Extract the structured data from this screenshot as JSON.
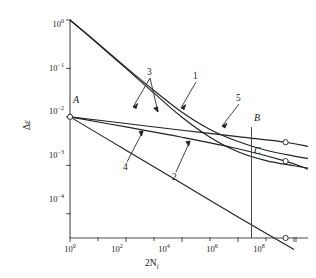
{
  "chart_data": {
    "type": "line",
    "title": "",
    "xlabel": "2N_f",
    "ylabel": "Δε",
    "xscale": "log",
    "yscale": "log",
    "xlim": [
      1,
      316000000.0
    ],
    "ylim": [
      3.16e-05,
      1
    ],
    "grid": false,
    "legend": "none",
    "x_ticks": [
      {
        "value": 1,
        "mantissa": "10",
        "exponent": "0"
      },
      {
        "value": 100,
        "mantissa": "10",
        "exponent": "2"
      },
      {
        "value": 10000,
        "mantissa": "10",
        "exponent": "4"
      },
      {
        "value": 1000000,
        "mantissa": "10",
        "exponent": "6"
      },
      {
        "value": 100000000,
        "mantissa": "10",
        "exponent": "8"
      }
    ],
    "y_ticks": [
      {
        "value": 1,
        "mantissa": "10",
        "exponent": "0"
      },
      {
        "value": 0.1,
        "mantissa": "10",
        "exponent": "−1"
      },
      {
        "value": 0.01,
        "mantissa": "10",
        "exponent": "−2"
      },
      {
        "value": 0.001,
        "mantissa": "10",
        "exponent": "−3"
      },
      {
        "value": 0.0001,
        "mantissa": "10",
        "exponent": "−4"
      }
    ],
    "series": [
      {
        "name": "1",
        "label": "1",
        "points": [
          [
            1,
            1.0
          ],
          [
            10,
            0.33
          ],
          [
            100,
            0.105
          ],
          [
            1000,
            0.035
          ],
          [
            10000,
            0.0125
          ],
          [
            100000,
            0.0055
          ],
          [
            1000000,
            0.0031
          ],
          [
            10000000,
            0.00205
          ],
          [
            100000000,
            0.00155
          ],
          [
            316000000,
            0.00138
          ]
        ]
      },
      {
        "name": "3",
        "label": "3",
        "points": [
          [
            1,
            1.0
          ],
          [
            10,
            0.32
          ],
          [
            100,
            0.1
          ],
          [
            1000,
            0.031
          ],
          [
            10000,
            0.0098
          ],
          [
            100000,
            0.0038
          ],
          [
            1000000,
            0.0019
          ],
          [
            10000000,
            0.00125
          ],
          [
            100000000,
            0.00098
          ],
          [
            316000000,
            0.00088
          ]
        ]
      },
      {
        "name": "5",
        "label": "5",
        "points": [
          [
            1,
            0.01
          ],
          [
            100,
            0.0073
          ],
          [
            10000,
            0.0053
          ],
          [
            1000000,
            0.0039
          ],
          [
            50000000,
            0.003
          ],
          [
            316000000,
            0.00245
          ]
        ]
      },
      {
        "name": "4",
        "label": "4",
        "points": [
          [
            1,
            0.01
          ],
          [
            100,
            0.0062
          ],
          [
            10000,
            0.0038
          ],
          [
            1000000,
            0.0022
          ],
          [
            50000000,
            0.00122
          ],
          [
            316000000,
            0.00083
          ]
        ]
      },
      {
        "name": "2",
        "label": "2",
        "points": [
          [
            1,
            0.01
          ],
          [
            100,
            0.00205
          ],
          [
            10000,
            0.00042
          ],
          [
            1000000,
            8.6e-05
          ],
          [
            100000000,
            1.84e-05
          ]
        ]
      }
    ],
    "annotations": [
      {
        "label": "1",
        "type": "curve-callout",
        "target_series": "1"
      },
      {
        "label": "2",
        "type": "curve-callout",
        "target_series": "2"
      },
      {
        "label": "3",
        "type": "curve-callout",
        "target_series": "3"
      },
      {
        "label": "4",
        "type": "curve-callout",
        "target_series": "4"
      },
      {
        "label": "5",
        "type": "curve-callout",
        "target_series": "5"
      }
    ],
    "markers": [
      {
        "label": "A",
        "x": 1,
        "y": 0.01,
        "style": "open-circle"
      },
      {
        "label": "B",
        "x": 50000000,
        "y": 0.003,
        "style": "open-circle"
      },
      {
        "label": "C",
        "x": 50000000,
        "y": 0.00122,
        "style": "open-circle"
      },
      {
        "label": "",
        "x": 50000000,
        "y": 3.16e-05,
        "style": "open-circle"
      }
    ]
  },
  "axes": {
    "y_title_text": "Δε",
    "x_title_mantissa": "2N",
    "x_title_sub": "f"
  }
}
